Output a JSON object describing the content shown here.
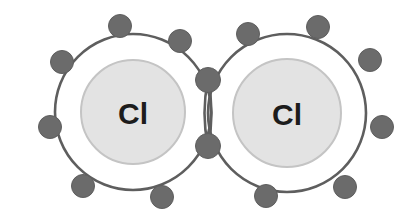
{
  "diagram": {
    "title": "Chlorine molecule covalent bond diagram",
    "type": "lewis-dot-shell-diagram",
    "molecule_formula": "Cl2",
    "bond_type": "single covalent bond",
    "canvas": {
      "width": 415,
      "height": 220,
      "background": "#ffffff"
    },
    "colors": {
      "background": "#ffffff",
      "atom_fill": "#e3e3e3",
      "atom_stroke": "#c4c4c4",
      "shell_stroke": "#5e5e5e",
      "electron_fill": "#6b6b6b",
      "electron_stroke": "#5e5e5e",
      "label_color": "#1c1c1c"
    },
    "geometry": {
      "shell_stroke_width": 2.6,
      "atom_stroke_width": 2.0,
      "electron_radius": 11.5,
      "shared_electron_radius": 12.5
    },
    "atoms": [
      {
        "id": "atom-left",
        "label": "Cl",
        "element_name": "Chlorine",
        "center_x": 133,
        "center_y": 112,
        "body_radius": 52,
        "shell_radius": 78,
        "label_font_size": 30
      },
      {
        "id": "atom-right",
        "label": "Cl",
        "element_name": "Chlorine",
        "center_x": 287,
        "center_y": 113,
        "body_radius": 54,
        "shell_radius": 79,
        "label_font_size": 30
      }
    ],
    "lone_electrons": [
      {
        "owner": "atom-left",
        "x": 120,
        "y": 26
      },
      {
        "owner": "atom-left",
        "x": 180,
        "y": 41
      },
      {
        "owner": "atom-left",
        "x": 62,
        "y": 62
      },
      {
        "owner": "atom-left",
        "x": 50,
        "y": 127
      },
      {
        "owner": "atom-left",
        "x": 83,
        "y": 186
      },
      {
        "owner": "atom-left",
        "x": 162,
        "y": 197
      },
      {
        "owner": "atom-right",
        "x": 248,
        "y": 34
      },
      {
        "owner": "atom-right",
        "x": 318,
        "y": 27
      },
      {
        "owner": "atom-right",
        "x": 370,
        "y": 60
      },
      {
        "owner": "atom-right",
        "x": 382,
        "y": 127
      },
      {
        "owner": "atom-right",
        "x": 345,
        "y": 187
      },
      {
        "owner": "atom-right",
        "x": 266,
        "y": 196
      }
    ],
    "shared_electrons": [
      {
        "id": "shared-electron-top",
        "x": 208,
        "y": 80
      },
      {
        "id": "shared-electron-bottom",
        "x": 208,
        "y": 146
      }
    ],
    "overlap_lens": {
      "top_x": 208,
      "top_y": 80,
      "bottom_x": 208,
      "bottom_y": 146,
      "bulge": 7
    },
    "electron_counts": {
      "left_lone": 6,
      "right_lone": 6,
      "shared": 2,
      "total_outer_shell_each": 8
    }
  }
}
